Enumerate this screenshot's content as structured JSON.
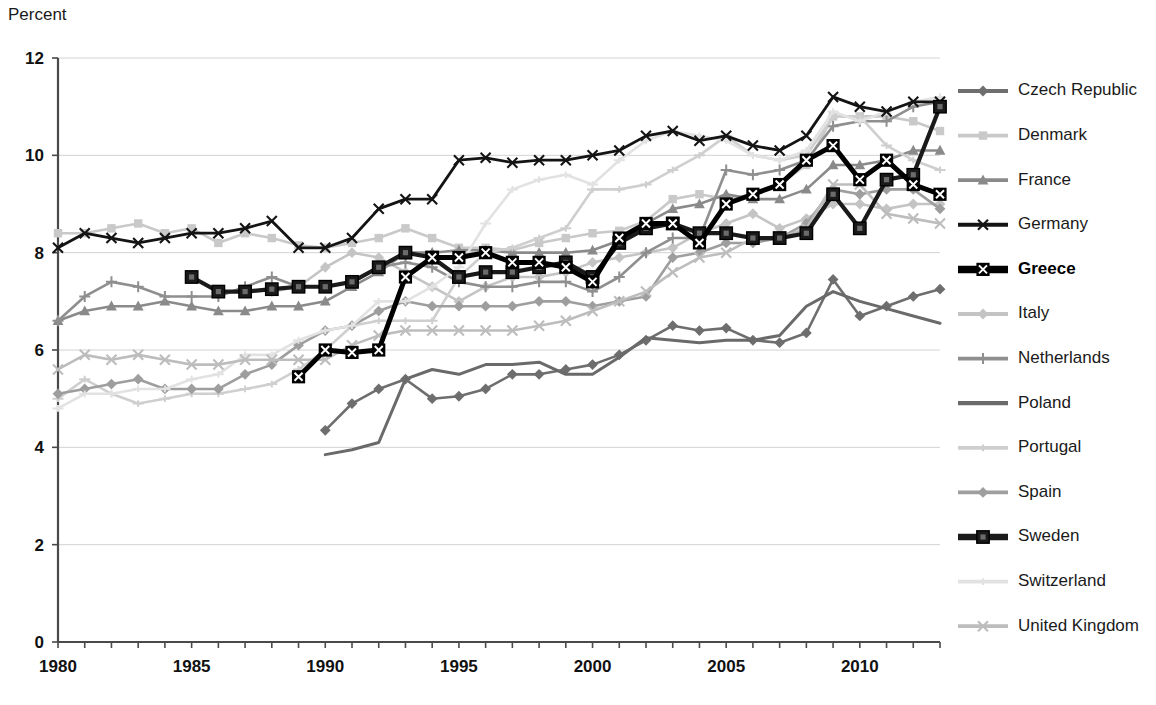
{
  "chart_data": {
    "type": "line",
    "title": "",
    "ylabel": "Percent",
    "xlabel": "",
    "ylim": [
      0,
      12
    ],
    "xlim": [
      1980,
      2013
    ],
    "yticks": [
      0,
      2,
      4,
      6,
      8,
      10,
      12
    ],
    "xticks": [
      1980,
      1985,
      1990,
      1995,
      2000,
      2005,
      2010
    ],
    "xtick_labels": [
      "1980",
      "1985",
      "1990",
      "1995",
      "2000",
      "2005",
      "2010"
    ],
    "ytick_labels": [
      "0",
      "2",
      "4",
      "6",
      "8",
      "10",
      "12"
    ],
    "grid": "horizontal",
    "legend_position": "right",
    "x": [
      1980,
      1981,
      1982,
      1983,
      1984,
      1985,
      1986,
      1987,
      1988,
      1989,
      1990,
      1991,
      1992,
      1993,
      1994,
      1995,
      1996,
      1997,
      1998,
      1999,
      2000,
      2001,
      2002,
      2003,
      2004,
      2005,
      2006,
      2007,
      2008,
      2009,
      2010,
      2011,
      2012,
      2013
    ],
    "series": [
      {
        "name": "Czech Republic",
        "color": "#6e6e6e",
        "width": 2.6,
        "marker": "diamond",
        "bold": false,
        "start_year": 1990,
        "values": [
          null,
          null,
          null,
          null,
          null,
          null,
          null,
          null,
          null,
          null,
          4.35,
          4.9,
          5.2,
          5.4,
          5.0,
          5.05,
          5.2,
          5.5,
          5.5,
          5.6,
          5.7,
          5.9,
          6.2,
          6.5,
          6.4,
          6.45,
          6.2,
          6.15,
          6.35,
          7.45,
          6.7,
          6.9,
          7.1,
          7.25
        ]
      },
      {
        "name": "Denmark",
        "color": "#c9c9c9",
        "width": 2.6,
        "marker": "square",
        "bold": false,
        "start_year": 1980,
        "values": [
          8.4,
          8.4,
          8.5,
          8.6,
          8.4,
          8.5,
          8.2,
          8.4,
          8.3,
          8.15,
          8.1,
          8.2,
          8.3,
          8.5,
          8.3,
          8.1,
          8.1,
          8.05,
          8.2,
          8.3,
          8.4,
          8.45,
          8.65,
          9.1,
          9.2,
          9.1,
          9.2,
          9.4,
          9.8,
          10.8,
          10.8,
          10.8,
          10.7,
          10.5
        ]
      },
      {
        "name": "France",
        "color": "#8a8a8a",
        "width": 2.6,
        "marker": "triangle",
        "bold": false,
        "start_year": 1980,
        "values": [
          6.6,
          6.8,
          6.9,
          6.9,
          7.0,
          6.9,
          6.8,
          6.8,
          6.9,
          6.9,
          7.0,
          7.3,
          7.6,
          8.0,
          8.0,
          8.05,
          8.05,
          8.0,
          8.0,
          8.0,
          8.05,
          8.25,
          8.6,
          8.9,
          9.0,
          9.2,
          9.1,
          9.1,
          9.3,
          9.8,
          9.8,
          9.9,
          10.1,
          10.1
        ]
      },
      {
        "name": "Germany",
        "color": "#141414",
        "width": 2.8,
        "marker": "x",
        "bold": false,
        "start_year": 1980,
        "values": [
          8.1,
          8.4,
          8.3,
          8.2,
          8.3,
          8.4,
          8.4,
          8.5,
          8.65,
          8.1,
          8.1,
          8.3,
          8.9,
          9.1,
          9.1,
          9.9,
          9.95,
          9.85,
          9.9,
          9.9,
          10.0,
          10.1,
          10.4,
          10.5,
          10.3,
          10.4,
          10.2,
          10.1,
          10.4,
          11.2,
          11.0,
          10.9,
          11.1,
          11.1
        ]
      },
      {
        "name": "Greece",
        "color": "#000000",
        "width": 5.0,
        "marker": "squarex",
        "bold": true,
        "start_year": 1989,
        "values": [
          null,
          null,
          null,
          null,
          null,
          null,
          null,
          null,
          null,
          5.45,
          6.0,
          5.95,
          6.0,
          7.5,
          7.9,
          7.9,
          8.0,
          7.8,
          7.8,
          7.7,
          7.4,
          8.3,
          8.6,
          8.6,
          8.2,
          9.0,
          9.2,
          9.4,
          9.9,
          10.2,
          9.5,
          9.9,
          9.4,
          9.2
        ]
      },
      {
        "name": "Italy",
        "color": "#c4c4c4",
        "width": 2.6,
        "marker": "diamond",
        "bold": false,
        "start_year": 1988,
        "values": [
          null,
          null,
          null,
          null,
          null,
          null,
          null,
          null,
          7.2,
          7.3,
          7.7,
          8.0,
          7.9,
          7.6,
          7.3,
          7.0,
          7.3,
          7.5,
          7.5,
          7.6,
          7.8,
          7.9,
          8.0,
          8.1,
          8.4,
          8.6,
          8.8,
          8.5,
          8.7,
          9.0,
          9.0,
          8.9,
          9.0,
          9.0
        ]
      },
      {
        "name": "Netherlands",
        "color": "#8f8f8f",
        "width": 2.6,
        "marker": "plus",
        "bold": false,
        "start_year": 1980,
        "values": [
          6.6,
          7.1,
          7.4,
          7.3,
          7.1,
          7.1,
          7.1,
          7.3,
          7.5,
          7.3,
          7.3,
          7.4,
          7.7,
          7.8,
          7.7,
          7.4,
          7.3,
          7.3,
          7.4,
          7.4,
          7.2,
          7.5,
          8.0,
          8.3,
          8.3,
          9.7,
          9.6,
          9.7,
          9.9,
          10.6,
          10.7,
          10.7,
          11.0,
          11.1
        ]
      },
      {
        "name": "Poland",
        "color": "#6a6a6a",
        "width": 3.0,
        "marker": "none",
        "bold": false,
        "start_year": 1990,
        "values": [
          null,
          null,
          null,
          null,
          null,
          null,
          null,
          null,
          null,
          null,
          3.85,
          3.95,
          4.1,
          5.4,
          5.6,
          5.5,
          5.7,
          5.7,
          5.75,
          5.5,
          5.5,
          5.85,
          6.25,
          6.2,
          6.15,
          6.2,
          6.2,
          6.3,
          6.9,
          7.2,
          7.0,
          6.85,
          6.7,
          6.55
        ]
      },
      {
        "name": "Portugal",
        "color": "#cfcfcf",
        "width": 2.6,
        "marker": "dash",
        "bold": false,
        "start_year": 1980,
        "values": [
          5.0,
          5.4,
          5.1,
          4.9,
          5.0,
          5.1,
          5.1,
          5.2,
          5.3,
          5.6,
          6.0,
          6.5,
          6.6,
          6.6,
          6.6,
          7.5,
          8.0,
          8.1,
          8.3,
          8.5,
          9.3,
          9.3,
          9.4,
          9.7,
          10.0,
          10.4,
          10.0,
          9.9,
          10.0,
          10.8,
          10.8,
          10.2,
          9.9,
          9.7
        ]
      },
      {
        "name": "Spain",
        "color": "#9e9e9e",
        "width": 2.6,
        "marker": "diamond",
        "bold": false,
        "start_year": 1980,
        "values": [
          5.1,
          5.2,
          5.3,
          5.4,
          5.2,
          5.2,
          5.2,
          5.5,
          5.7,
          6.1,
          6.4,
          6.5,
          6.8,
          7.0,
          6.9,
          6.9,
          6.9,
          6.9,
          7.0,
          7.0,
          6.9,
          7.0,
          7.1,
          7.9,
          8.0,
          8.2,
          8.2,
          8.3,
          8.6,
          9.3,
          9.2,
          9.3,
          9.3,
          8.9
        ]
      },
      {
        "name": "Sweden",
        "color": "#1a1a1a",
        "width": 4.2,
        "marker": "bigsquare",
        "bold": true,
        "start_year": 1985,
        "values": [
          null,
          null,
          null,
          null,
          null,
          7.5,
          7.2,
          7.2,
          7.25,
          7.3,
          7.3,
          7.4,
          7.7,
          8.0,
          7.9,
          7.5,
          7.6,
          7.6,
          7.7,
          7.8,
          7.5,
          8.2,
          8.5,
          8.6,
          8.4,
          8.4,
          8.3,
          8.3,
          8.4,
          9.2,
          8.5,
          9.5,
          9.6,
          11.0
        ]
      },
      {
        "name": "Switzerland",
        "color": "#e2e2e2",
        "width": 2.6,
        "marker": "dash",
        "bold": false,
        "start_year": 1980,
        "values": [
          4.8,
          5.1,
          5.1,
          5.2,
          5.2,
          5.4,
          5.5,
          5.9,
          5.9,
          6.2,
          6.4,
          6.5,
          7.0,
          7.0,
          7.3,
          7.7,
          8.6,
          9.3,
          9.5,
          9.6,
          9.4,
          9.9,
          10.3,
          10.5,
          10.4,
          10.3,
          10.0,
          9.9,
          10.1,
          10.9,
          10.7,
          10.9,
          11.1,
          11.2
        ]
      },
      {
        "name": "United Kingdom",
        "color": "#bdbdbd",
        "width": 2.6,
        "marker": "x",
        "bold": false,
        "start_year": 1980,
        "values": [
          5.6,
          5.9,
          5.8,
          5.9,
          5.8,
          5.7,
          5.7,
          5.8,
          5.8,
          5.8,
          5.8,
          6.1,
          6.3,
          6.4,
          6.4,
          6.4,
          6.4,
          6.4,
          6.5,
          6.6,
          6.8,
          7.0,
          7.2,
          7.6,
          7.9,
          8.0,
          8.3,
          8.3,
          8.5,
          9.4,
          9.4,
          8.8,
          8.7,
          8.6
        ]
      }
    ]
  },
  "legend": {
    "items": [
      {
        "label": "Czech Republic"
      },
      {
        "label": "Denmark"
      },
      {
        "label": "France"
      },
      {
        "label": "Germany"
      },
      {
        "label": "Greece"
      },
      {
        "label": "Italy"
      },
      {
        "label": "Netherlands"
      },
      {
        "label": "Poland"
      },
      {
        "label": "Portugal"
      },
      {
        "label": "Spain"
      },
      {
        "label": "Sweden"
      },
      {
        "label": "Switzerland"
      },
      {
        "label": "United Kingdom"
      }
    ]
  },
  "colors": {
    "background": "#ffffff",
    "axis": "#4a4a4a",
    "grid": "#d2d2d2",
    "text": "#111111",
    "highlight": "#000000"
  }
}
